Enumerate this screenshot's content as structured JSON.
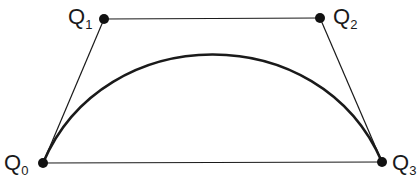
{
  "diagram": {
    "colors": {
      "stroke": "#1a1a1a",
      "background": "#ffffff"
    },
    "points": [
      {
        "id": "Q0",
        "letter": "Q",
        "subscript": "0"
      },
      {
        "id": "Q1",
        "letter": "Q",
        "subscript": "1"
      },
      {
        "id": "Q2",
        "letter": "Q",
        "subscript": "2"
      },
      {
        "id": "Q3",
        "letter": "Q",
        "subscript": "3"
      }
    ]
  }
}
